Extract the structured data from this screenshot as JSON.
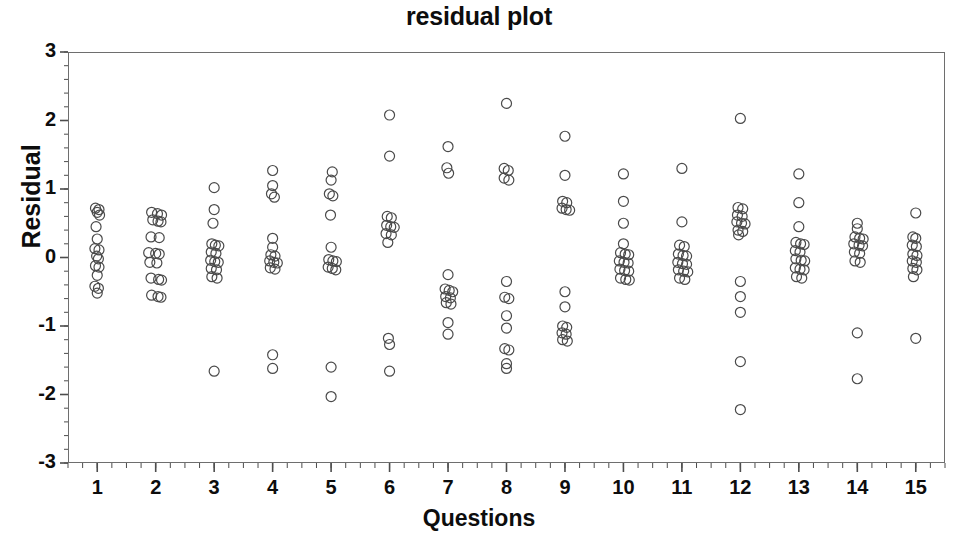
{
  "chart_data": {
    "type": "scatter",
    "title": "residual plot",
    "xlabel": "Questions",
    "ylabel": "Residual",
    "xlim": [
      0.5,
      15.5
    ],
    "ylim": [
      -3,
      3
    ],
    "grid": false,
    "legend": null,
    "marker": "open-circle",
    "marker_color": "#4a4a4a",
    "xticks": [
      "1",
      "2",
      "3",
      "4",
      "5",
      "6",
      "7",
      "8",
      "9",
      "10",
      "11",
      "12",
      "13",
      "14",
      "15"
    ],
    "xtick_values": [
      1,
      2,
      3,
      4,
      5,
      6,
      7,
      8,
      9,
      10,
      11,
      12,
      13,
      14,
      15
    ],
    "yticks": [
      "3",
      "2",
      "1",
      "0",
      "-1",
      "-2",
      "-3"
    ],
    "ytick_values": [
      3,
      2,
      1,
      0,
      -1,
      -2,
      -3
    ],
    "y_minor_tick_step": 0.2,
    "x_minor_tick_step": 0.25,
    "series": [
      {
        "name": "residuals",
        "points": [
          {
            "x": 0.97,
            "y": 0.72
          },
          {
            "x": 1.03,
            "y": 0.7
          },
          {
            "x": 1.0,
            "y": 0.66
          },
          {
            "x": 1.04,
            "y": 0.62
          },
          {
            "x": 0.98,
            "y": 0.45
          },
          {
            "x": 1.0,
            "y": 0.27
          },
          {
            "x": 0.96,
            "y": 0.13
          },
          {
            "x": 1.03,
            "y": 0.11
          },
          {
            "x": 0.99,
            "y": 0.02
          },
          {
            "x": 1.02,
            "y": -0.02
          },
          {
            "x": 0.97,
            "y": -0.12
          },
          {
            "x": 1.03,
            "y": -0.14
          },
          {
            "x": 1.0,
            "y": -0.26
          },
          {
            "x": 0.96,
            "y": -0.42
          },
          {
            "x": 1.02,
            "y": -0.45
          },
          {
            "x": 1.0,
            "y": -0.52
          },
          {
            "x": 1.93,
            "y": 0.66
          },
          {
            "x": 2.03,
            "y": 0.64
          },
          {
            "x": 2.1,
            "y": 0.62
          },
          {
            "x": 1.95,
            "y": 0.55
          },
          {
            "x": 2.04,
            "y": 0.53
          },
          {
            "x": 2.09,
            "y": 0.52
          },
          {
            "x": 1.92,
            "y": 0.3
          },
          {
            "x": 2.06,
            "y": 0.29
          },
          {
            "x": 1.88,
            "y": 0.07
          },
          {
            "x": 2.0,
            "y": 0.06
          },
          {
            "x": 2.06,
            "y": 0.05
          },
          {
            "x": 1.9,
            "y": -0.07
          },
          {
            "x": 2.02,
            "y": -0.08
          },
          {
            "x": 1.92,
            "y": -0.3
          },
          {
            "x": 2.05,
            "y": -0.32
          },
          {
            "x": 2.1,
            "y": -0.33
          },
          {
            "x": 1.93,
            "y": -0.55
          },
          {
            "x": 2.04,
            "y": -0.57
          },
          {
            "x": 2.09,
            "y": -0.58
          },
          {
            "x": 3.0,
            "y": 1.02
          },
          {
            "x": 3.0,
            "y": 0.7
          },
          {
            "x": 2.98,
            "y": 0.5
          },
          {
            "x": 2.96,
            "y": 0.2
          },
          {
            "x": 3.02,
            "y": 0.18
          },
          {
            "x": 3.08,
            "y": 0.17
          },
          {
            "x": 2.95,
            "y": 0.08
          },
          {
            "x": 3.03,
            "y": 0.06
          },
          {
            "x": 2.94,
            "y": -0.04
          },
          {
            "x": 3.01,
            "y": -0.06
          },
          {
            "x": 3.07,
            "y": -0.07
          },
          {
            "x": 2.95,
            "y": -0.16
          },
          {
            "x": 3.04,
            "y": -0.18
          },
          {
            "x": 2.96,
            "y": -0.28
          },
          {
            "x": 3.05,
            "y": -0.3
          },
          {
            "x": 3.0,
            "y": -1.66
          },
          {
            "x": 4.0,
            "y": 1.27
          },
          {
            "x": 4.0,
            "y": 1.05
          },
          {
            "x": 3.98,
            "y": 0.93
          },
          {
            "x": 4.03,
            "y": 0.88
          },
          {
            "x": 4.0,
            "y": 0.28
          },
          {
            "x": 4.0,
            "y": 0.15
          },
          {
            "x": 3.97,
            "y": 0.04
          },
          {
            "x": 4.04,
            "y": 0.02
          },
          {
            "x": 3.95,
            "y": -0.05
          },
          {
            "x": 4.02,
            "y": -0.07
          },
          {
            "x": 4.08,
            "y": -0.08
          },
          {
            "x": 3.96,
            "y": -0.15
          },
          {
            "x": 4.04,
            "y": -0.17
          },
          {
            "x": 4.0,
            "y": -1.42
          },
          {
            "x": 4.0,
            "y": -1.62
          },
          {
            "x": 5.02,
            "y": 1.25
          },
          {
            "x": 5.0,
            "y": 1.13
          },
          {
            "x": 4.97,
            "y": 0.93
          },
          {
            "x": 5.03,
            "y": 0.9
          },
          {
            "x": 4.99,
            "y": 0.62
          },
          {
            "x": 5.0,
            "y": 0.15
          },
          {
            "x": 4.96,
            "y": -0.03
          },
          {
            "x": 5.03,
            "y": -0.05
          },
          {
            "x": 5.09,
            "y": -0.06
          },
          {
            "x": 4.95,
            "y": -0.14
          },
          {
            "x": 5.02,
            "y": -0.16
          },
          {
            "x": 5.08,
            "y": -0.18
          },
          {
            "x": 5.0,
            "y": -1.6
          },
          {
            "x": 5.0,
            "y": -2.03
          },
          {
            "x": 6.0,
            "y": 2.08
          },
          {
            "x": 6.0,
            "y": 1.48
          },
          {
            "x": 5.96,
            "y": 0.6
          },
          {
            "x": 6.03,
            "y": 0.58
          },
          {
            "x": 5.95,
            "y": 0.47
          },
          {
            "x": 6.02,
            "y": 0.45
          },
          {
            "x": 6.08,
            "y": 0.44
          },
          {
            "x": 5.94,
            "y": 0.35
          },
          {
            "x": 6.03,
            "y": 0.33
          },
          {
            "x": 5.97,
            "y": 0.22
          },
          {
            "x": 5.98,
            "y": -1.18
          },
          {
            "x": 6.0,
            "y": -1.27
          },
          {
            "x": 6.0,
            "y": -1.66
          },
          {
            "x": 7.0,
            "y": 1.62
          },
          {
            "x": 6.98,
            "y": 1.31
          },
          {
            "x": 7.01,
            "y": 1.23
          },
          {
            "x": 7.0,
            "y": -0.25
          },
          {
            "x": 6.95,
            "y": -0.46
          },
          {
            "x": 7.02,
            "y": -0.48
          },
          {
            "x": 7.08,
            "y": -0.5
          },
          {
            "x": 6.96,
            "y": -0.57
          },
          {
            "x": 7.04,
            "y": -0.59
          },
          {
            "x": 6.97,
            "y": -0.66
          },
          {
            "x": 7.05,
            "y": -0.68
          },
          {
            "x": 7.0,
            "y": -0.95
          },
          {
            "x": 7.0,
            "y": -1.12
          },
          {
            "x": 8.0,
            "y": 2.25
          },
          {
            "x": 7.96,
            "y": 1.3
          },
          {
            "x": 8.03,
            "y": 1.27
          },
          {
            "x": 7.96,
            "y": 1.16
          },
          {
            "x": 8.04,
            "y": 1.13
          },
          {
            "x": 8.0,
            "y": -0.35
          },
          {
            "x": 7.97,
            "y": -0.58
          },
          {
            "x": 8.04,
            "y": -0.6
          },
          {
            "x": 8.0,
            "y": -0.85
          },
          {
            "x": 8.0,
            "y": -1.03
          },
          {
            "x": 7.97,
            "y": -1.33
          },
          {
            "x": 8.04,
            "y": -1.35
          },
          {
            "x": 8.0,
            "y": -1.55
          },
          {
            "x": 8.0,
            "y": -1.62
          },
          {
            "x": 9.0,
            "y": 1.77
          },
          {
            "x": 9.0,
            "y": 1.2
          },
          {
            "x": 8.96,
            "y": 0.82
          },
          {
            "x": 9.03,
            "y": 0.8
          },
          {
            "x": 8.95,
            "y": 0.72
          },
          {
            "x": 9.02,
            "y": 0.7
          },
          {
            "x": 9.08,
            "y": 0.69
          },
          {
            "x": 9.0,
            "y": -0.5
          },
          {
            "x": 9.0,
            "y": -0.72
          },
          {
            "x": 8.96,
            "y": -1.0
          },
          {
            "x": 9.03,
            "y": -1.02
          },
          {
            "x": 8.95,
            "y": -1.1
          },
          {
            "x": 9.02,
            "y": -1.12
          },
          {
            "x": 8.96,
            "y": -1.2
          },
          {
            "x": 9.04,
            "y": -1.22
          },
          {
            "x": 10.0,
            "y": 1.22
          },
          {
            "x": 10.0,
            "y": 0.82
          },
          {
            "x": 10.0,
            "y": 0.5
          },
          {
            "x": 10.0,
            "y": 0.2
          },
          {
            "x": 9.95,
            "y": 0.07
          },
          {
            "x": 10.03,
            "y": 0.05
          },
          {
            "x": 10.09,
            "y": 0.04
          },
          {
            "x": 9.93,
            "y": -0.05
          },
          {
            "x": 10.01,
            "y": -0.07
          },
          {
            "x": 10.08,
            "y": -0.08
          },
          {
            "x": 9.94,
            "y": -0.17
          },
          {
            "x": 10.02,
            "y": -0.19
          },
          {
            "x": 10.09,
            "y": -0.2
          },
          {
            "x": 9.95,
            "y": -0.3
          },
          {
            "x": 10.04,
            "y": -0.32
          },
          {
            "x": 10.1,
            "y": -0.33
          },
          {
            "x": 11.0,
            "y": 1.3
          },
          {
            "x": 11.0,
            "y": 0.52
          },
          {
            "x": 10.96,
            "y": 0.18
          },
          {
            "x": 11.04,
            "y": 0.16
          },
          {
            "x": 10.94,
            "y": 0.05
          },
          {
            "x": 11.02,
            "y": 0.03
          },
          {
            "x": 11.08,
            "y": 0.02
          },
          {
            "x": 10.93,
            "y": -0.07
          },
          {
            "x": 11.01,
            "y": -0.09
          },
          {
            "x": 11.08,
            "y": -0.1
          },
          {
            "x": 10.94,
            "y": -0.18
          },
          {
            "x": 11.03,
            "y": -0.2
          },
          {
            "x": 11.1,
            "y": -0.21
          },
          {
            "x": 10.96,
            "y": -0.3
          },
          {
            "x": 11.05,
            "y": -0.32
          },
          {
            "x": 12.0,
            "y": 2.03
          },
          {
            "x": 11.96,
            "y": 0.73
          },
          {
            "x": 12.04,
            "y": 0.71
          },
          {
            "x": 11.95,
            "y": 0.62
          },
          {
            "x": 12.03,
            "y": 0.6
          },
          {
            "x": 11.94,
            "y": 0.52
          },
          {
            "x": 12.02,
            "y": 0.5
          },
          {
            "x": 12.08,
            "y": 0.49
          },
          {
            "x": 11.96,
            "y": 0.4
          },
          {
            "x": 12.04,
            "y": 0.38
          },
          {
            "x": 11.97,
            "y": 0.33
          },
          {
            "x": 12.0,
            "y": -0.35
          },
          {
            "x": 12.0,
            "y": -0.57
          },
          {
            "x": 12.0,
            "y": -0.8
          },
          {
            "x": 12.0,
            "y": -1.52
          },
          {
            "x": 12.0,
            "y": -2.22
          },
          {
            "x": 13.0,
            "y": 1.22
          },
          {
            "x": 13.0,
            "y": 0.8
          },
          {
            "x": 13.0,
            "y": 0.45
          },
          {
            "x": 12.95,
            "y": 0.22
          },
          {
            "x": 13.03,
            "y": 0.2
          },
          {
            "x": 13.09,
            "y": 0.19
          },
          {
            "x": 12.94,
            "y": 0.1
          },
          {
            "x": 13.02,
            "y": 0.08
          },
          {
            "x": 12.95,
            "y": -0.02
          },
          {
            "x": 13.04,
            "y": -0.04
          },
          {
            "x": 13.1,
            "y": -0.05
          },
          {
            "x": 12.94,
            "y": -0.15
          },
          {
            "x": 13.02,
            "y": -0.17
          },
          {
            "x": 13.09,
            "y": -0.18
          },
          {
            "x": 12.96,
            "y": -0.28
          },
          {
            "x": 13.05,
            "y": -0.3
          },
          {
            "x": 14.0,
            "y": 0.5
          },
          {
            "x": 14.0,
            "y": 0.42
          },
          {
            "x": 13.96,
            "y": 0.3
          },
          {
            "x": 14.04,
            "y": 0.28
          },
          {
            "x": 14.1,
            "y": 0.27
          },
          {
            "x": 13.94,
            "y": 0.2
          },
          {
            "x": 14.03,
            "y": 0.18
          },
          {
            "x": 14.09,
            "y": 0.17
          },
          {
            "x": 13.95,
            "y": 0.08
          },
          {
            "x": 14.04,
            "y": 0.06
          },
          {
            "x": 13.96,
            "y": -0.05
          },
          {
            "x": 14.05,
            "y": -0.07
          },
          {
            "x": 14.0,
            "y": -1.1
          },
          {
            "x": 14.0,
            "y": -1.77
          },
          {
            "x": 15.0,
            "y": 0.65
          },
          {
            "x": 14.95,
            "y": 0.3
          },
          {
            "x": 15.0,
            "y": 0.28
          },
          {
            "x": 14.94,
            "y": 0.18
          },
          {
            "x": 15.01,
            "y": 0.16
          },
          {
            "x": 14.95,
            "y": 0.05
          },
          {
            "x": 15.02,
            "y": 0.03
          },
          {
            "x": 14.94,
            "y": -0.05
          },
          {
            "x": 15.01,
            "y": -0.07
          },
          {
            "x": 14.95,
            "y": -0.16
          },
          {
            "x": 15.02,
            "y": -0.18
          },
          {
            "x": 14.96,
            "y": -0.28
          },
          {
            "x": 15.0,
            "y": -1.18
          }
        ]
      }
    ]
  }
}
